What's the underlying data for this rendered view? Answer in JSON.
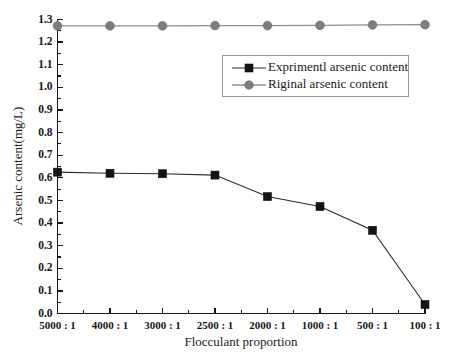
{
  "chart_data": {
    "type": "line",
    "title": "",
    "xlabel": "Flocculant proportion",
    "ylabel": "Arsenic content(mg/L)",
    "categories": [
      "5000 : 1",
      "4000 : 1",
      "3000 : 1",
      "2500 : 1",
      "2000 : 1",
      "1000 : 1",
      "500 : 1",
      "100 : 1"
    ],
    "ylim": [
      0.0,
      1.3
    ],
    "ytick_labels": [
      "0.0",
      "0.1",
      "0.2",
      "0.3",
      "0.4",
      "0.5",
      "0.6",
      "0.7",
      "0.8",
      "0.9",
      "1.0",
      "1.1",
      "1.2",
      "1.3"
    ],
    "ytick_values": [
      0.0,
      0.1,
      0.2,
      0.3,
      0.4,
      0.5,
      0.6,
      0.7,
      0.8,
      0.9,
      1.0,
      1.1,
      1.2,
      1.3
    ],
    "minor_ticks": true,
    "grid": false,
    "legend_position": "upper-right",
    "series": [
      {
        "name": "Exprimentl arsenic content",
        "marker": "square",
        "color": "#141414",
        "line_color": "#2b2b2b",
        "values": [
          0.625,
          0.62,
          0.618,
          0.612,
          0.517,
          0.473,
          0.368,
          0.04
        ]
      },
      {
        "name": "Riginal arsenic content",
        "marker": "circle",
        "color": "#7d7d7d",
        "line_color": "#8e8e8e",
        "values": [
          1.272,
          1.272,
          1.272,
          1.273,
          1.273,
          1.274,
          1.276,
          1.277
        ]
      }
    ]
  },
  "legend": {
    "entries": [
      {
        "label": "Exprimentl arsenic content",
        "marker": "square-marker-icon"
      },
      {
        "label": "Riginal arsenic content",
        "marker": "circle-marker-icon"
      }
    ]
  },
  "axes": {
    "y_title": "Arsenic content(mg/L)",
    "x_title": "Flocculant proportion"
  }
}
